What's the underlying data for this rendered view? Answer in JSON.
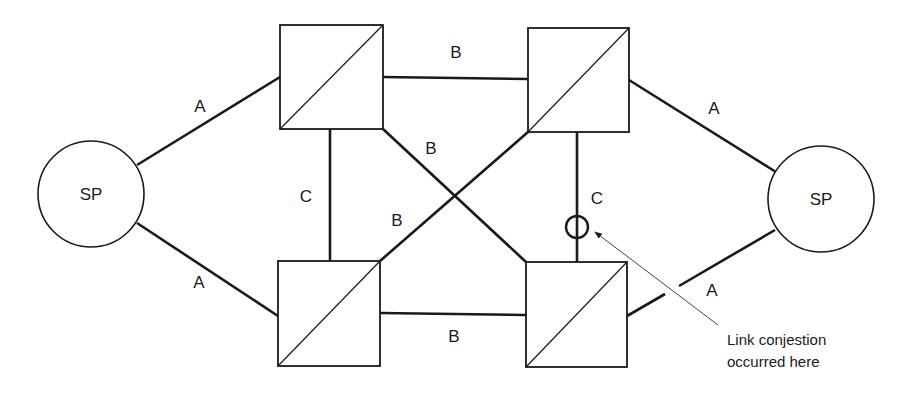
{
  "diagram": {
    "nodes": {
      "sp_left": {
        "label": "SP",
        "type": "signaling-point"
      },
      "sp_right": {
        "label": "SP",
        "type": "signaling-point"
      },
      "stp_top_left": {
        "type": "signal-transfer-point"
      },
      "stp_top_right": {
        "type": "signal-transfer-point"
      },
      "stp_bottom_left": {
        "type": "signal-transfer-point"
      },
      "stp_bottom_right": {
        "type": "signal-transfer-point"
      }
    },
    "links": {
      "a_left_top": "A",
      "a_left_bottom": "A",
      "a_right_top": "A",
      "a_right_bottom": "A",
      "b_top": "B",
      "b_bottom": "B",
      "b_diag_down": "B",
      "b_diag_up": "B",
      "c_left": "C",
      "c_right": "C"
    },
    "annotation": {
      "line1": "Link conjestion",
      "line2": "occurred here"
    },
    "colors": {
      "stroke": "#1a1a1a",
      "background": "#ffffff"
    }
  }
}
